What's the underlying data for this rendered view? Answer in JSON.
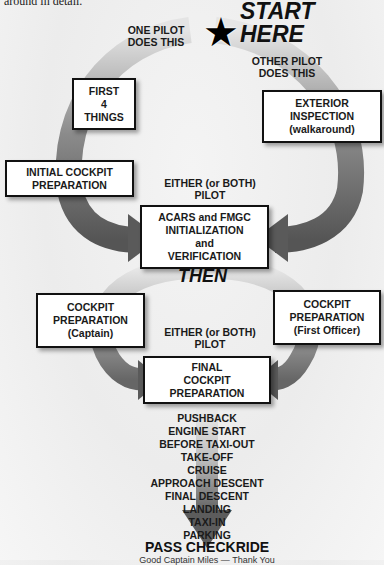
{
  "caption": "around in detail.",
  "header": {
    "start_here_line1": "START",
    "start_here_line2": "HERE",
    "star_icon": "★",
    "one_pilot_line1": "ONE PILOT",
    "one_pilot_line2": "DOES THIS",
    "other_pilot_line1": "OTHER PILOT",
    "other_pilot_line2": "DOES THIS"
  },
  "boxes": {
    "first_four": [
      "FIRST",
      "4",
      "THINGS"
    ],
    "exterior": [
      "EXTERIOR",
      "INSPECTION",
      "(walkaround)"
    ],
    "initial_cockpit": [
      "INITIAL COCKPIT",
      "PREPARATION"
    ],
    "acars": [
      "ACARS and FMGC",
      "INITIALIZATION",
      "and",
      "VERIFICATION"
    ],
    "cockpit_captain": [
      "COCKPIT",
      "PREPARATION",
      "(Captain)"
    ],
    "cockpit_fo": [
      "COCKPIT",
      "PREPARATION",
      "(First Officer)"
    ],
    "final_cockpit": [
      "FINAL",
      "COCKPIT",
      "PREPARATION"
    ]
  },
  "labels": {
    "either_top_line1": "EITHER (or BOTH)",
    "either_top_line2": "PILOT",
    "then": "THEN",
    "either_bottom_line1": "EITHER (or BOTH)",
    "either_bottom_line2": "PILOT"
  },
  "phases": [
    "PUSHBACK",
    "ENGINE START",
    "BEFORE TAXI-OUT",
    "TAKE-OFF",
    "CRUISE",
    "APPROACH DESCENT",
    "FINAL DESCENT",
    "LANDING",
    "TAXI-IN",
    "PARKING"
  ],
  "result": "PASS CHECKRIDE",
  "footer": "Good Captain Miles — Thank You",
  "colors": {
    "arrow_dark": "#5a5a5a",
    "arrow_light": "#d8d8d8",
    "box_border": "#111111",
    "background": "#ececec"
  }
}
